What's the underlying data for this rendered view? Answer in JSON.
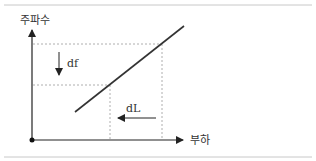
{
  "diagram": {
    "y_axis_label": "주파수",
    "x_axis_label": "부하",
    "delta_f_label": "df",
    "delta_l_label": "dL",
    "colors": {
      "axis": "#222222",
      "curve": "#333333",
      "dashed": "#9a9a9a",
      "frame": "#c8c8c8",
      "text": "#333333"
    }
  }
}
